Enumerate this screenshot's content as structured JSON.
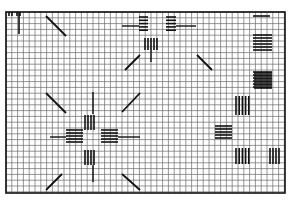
{
  "diagram": {
    "type": "pattern-grid",
    "grid": {
      "x0": 6,
      "y0": 12,
      "x1": 285,
      "y1": 193,
      "cell": 5.8,
      "line_color": "#6a6a6a",
      "border_color": "#111111"
    },
    "colors": {
      "stitch": "#111111",
      "background": "#ffffff"
    },
    "motifs": [
      {
        "name": "top-center-cross-motif",
        "cx": 157,
        "cy": 30
      },
      {
        "name": "lower-left-cross-motif",
        "cx": 92,
        "cy": 137
      },
      {
        "name": "right-stepped-motif",
        "cx": 248,
        "cy": 120
      },
      {
        "name": "top-right-bars",
        "cx": 263,
        "cy": 40
      }
    ]
  }
}
